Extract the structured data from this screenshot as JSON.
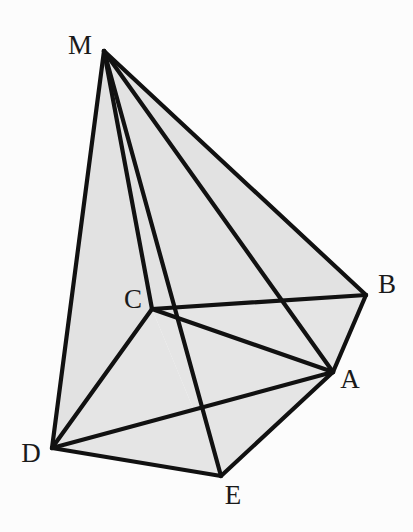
{
  "figure": {
    "canvas": {
      "width": 413,
      "height": 532
    },
    "background_color": "#fcfcfc",
    "stroke_color": "#111111",
    "face_fill_color": "#e2e2e2",
    "stroke_width": 4.2
  },
  "vertices": {
    "M": {
      "label": "M",
      "x": 104,
      "y": 51,
      "label_x": 80,
      "label_y": 48
    },
    "B": {
      "label": "B",
      "x": 366,
      "y": 295,
      "label_x": 387,
      "label_y": 287
    },
    "A": {
      "label": "A",
      "x": 333,
      "y": 372,
      "label_x": 350,
      "label_y": 382
    },
    "C": {
      "label": "C",
      "x": 152,
      "y": 309,
      "label_x": 133,
      "label_y": 302
    },
    "D": {
      "label": "D",
      "x": 52,
      "y": 448,
      "label_x": 31,
      "label_y": 456
    },
    "E": {
      "label": "E",
      "x": 221,
      "y": 476,
      "label_x": 233,
      "label_y": 498
    }
  },
  "faces": [
    {
      "name": "face-M-D-C",
      "points": "M,D,C",
      "fill": "#e2e2e2"
    },
    {
      "name": "face-M-C-B",
      "points": "M,C,B",
      "fill": "#e2e2e2"
    },
    {
      "name": "face-M-B-A",
      "points": "M,B,A",
      "fill": "#e2e2e2"
    },
    {
      "name": "face-C-B-A",
      "points": "C,B,A",
      "fill": "#e5e5e5"
    },
    {
      "name": "face-C-A-E",
      "points": "C,A,E",
      "fill": "#e5e5e5"
    },
    {
      "name": "face-C-E-D",
      "points": "C,E,D",
      "fill": "#e5e5e5"
    },
    {
      "name": "face-D-E-A",
      "points": "D,E,A",
      "fill": "#e5e5e5"
    }
  ],
  "edges": [
    {
      "name": "edge-M-D",
      "from": "M",
      "to": "D"
    },
    {
      "name": "edge-M-C",
      "from": "M",
      "to": "C"
    },
    {
      "name": "edge-M-E",
      "from": "M",
      "to": "E"
    },
    {
      "name": "edge-M-A",
      "from": "M",
      "to": "A"
    },
    {
      "name": "edge-M-B",
      "from": "M",
      "to": "B"
    },
    {
      "name": "edge-C-B",
      "from": "C",
      "to": "B"
    },
    {
      "name": "edge-B-A",
      "from": "B",
      "to": "A"
    },
    {
      "name": "edge-A-E",
      "from": "A",
      "to": "E"
    },
    {
      "name": "edge-E-D",
      "from": "E",
      "to": "D"
    },
    {
      "name": "edge-D-C",
      "from": "D",
      "to": "C"
    },
    {
      "name": "edge-C-A",
      "from": "C",
      "to": "A"
    },
    {
      "name": "edge-D-A",
      "from": "D",
      "to": "A"
    }
  ]
}
